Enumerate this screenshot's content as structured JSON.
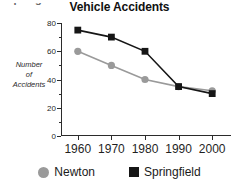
{
  "page": {
    "cut_off_heading": "Springfield"
  },
  "chart_data": {
    "type": "line",
    "title": "Vehicle Accidents",
    "xlabel": "",
    "ylabel": "Number of Accidents",
    "ylabel_lines": [
      "Number",
      "of",
      "Accidents"
    ],
    "categories": [
      "1960",
      "1970",
      "1980",
      "1990",
      "2000"
    ],
    "x": [
      1960,
      1970,
      1980,
      1990,
      2000
    ],
    "xlim": [
      1955,
      2005
    ],
    "ylim": [
      0,
      80
    ],
    "yticks": [
      0,
      20,
      40,
      60,
      80
    ],
    "ytick_labels": [
      "0",
      "20",
      "40",
      "60",
      "80"
    ],
    "grid": false,
    "legend_position": "bottom",
    "series": [
      {
        "name": "Newton",
        "marker": "circle",
        "color": "#9a9a9a",
        "values": [
          60,
          50,
          40,
          35,
          32
        ]
      },
      {
        "name": "Springfield",
        "marker": "square",
        "color": "#161616",
        "values": [
          75,
          70,
          60,
          35,
          30
        ]
      }
    ]
  },
  "legend": {
    "items": [
      {
        "label": "Newton",
        "marker": "circle-marker-icon",
        "color": "#9a9a9a"
      },
      {
        "label": "Springfield",
        "marker": "square-marker-icon",
        "color": "#161616"
      }
    ]
  }
}
